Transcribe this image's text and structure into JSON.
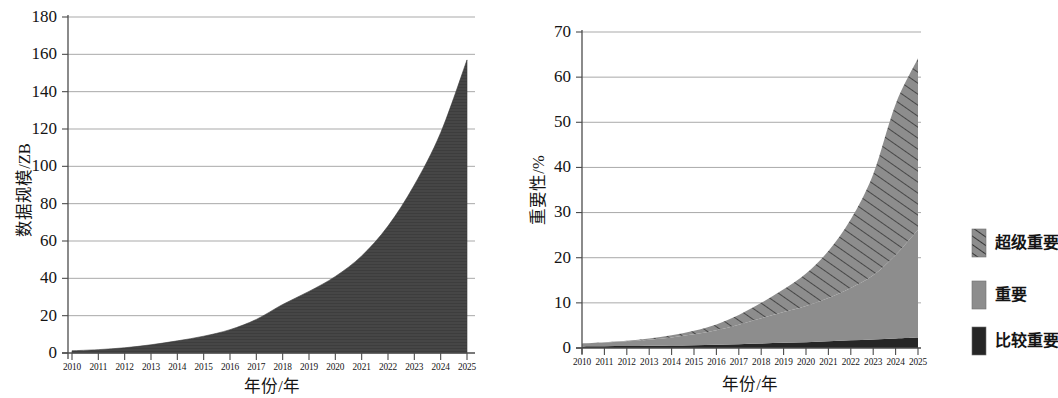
{
  "figure": {
    "panels": [
      "left-data-scale",
      "right-importance"
    ]
  },
  "chart_data": [
    {
      "id": "data-scale",
      "type": "area",
      "title": "",
      "xlabel": "年份/年",
      "ylabel": "数据规模/ZB",
      "xlim": [
        2009.6,
        2025.6
      ],
      "ylim": [
        0,
        180
      ],
      "yticks": [
        0,
        20,
        40,
        60,
        80,
        100,
        120,
        140,
        160,
        180
      ],
      "grid": true,
      "legend": "none",
      "fill_color": "#464646",
      "categories": [
        2010,
        2011,
        2012,
        2013,
        2014,
        2015,
        2016,
        2017,
        2018,
        2019,
        2020,
        2021,
        2022,
        2023,
        2024,
        2025
      ],
      "xtick_labels": [
        "2010",
        "2011",
        "2012",
        "2013",
        "2014",
        "2015",
        "2016",
        "2017",
        "2018",
        "2019",
        "2020",
        "2021",
        "2022",
        "2023",
        "2024",
        "2025"
      ],
      "series": [
        {
          "name": "数据规模",
          "values": [
            1.2,
            1.8,
            2.8,
            4.4,
            6.5,
            9.0,
            12.5,
            18.0,
            26.0,
            33.0,
            41.0,
            52.0,
            68.0,
            90.0,
            118.0,
            157.0
          ]
        }
      ]
    },
    {
      "id": "importance",
      "type": "area",
      "stacked": true,
      "title": "",
      "xlabel": "年份/年",
      "ylabel": "重要性/%",
      "xlim": [
        2009.6,
        2025.6
      ],
      "ylim": [
        0,
        70
      ],
      "yticks": [
        0,
        10,
        20,
        30,
        40,
        50,
        60,
        70
      ],
      "grid": true,
      "legend": "right",
      "categories": [
        2010,
        2011,
        2012,
        2013,
        2014,
        2015,
        2016,
        2017,
        2018,
        2019,
        2020,
        2021,
        2022,
        2023,
        2024,
        2025
      ],
      "xtick_labels": [
        "2010",
        "2011",
        "2012",
        "2013",
        "2014",
        "2015",
        "2016",
        "2017",
        "2018",
        "2019",
        "2020",
        "2021",
        "2022",
        "2023",
        "2024",
        "2025"
      ],
      "series": [
        {
          "name": "比较重要",
          "style": "solid-dark",
          "color": "#262626",
          "values": [
            0.35,
            0.38,
            0.42,
            0.48,
            0.55,
            0.62,
            0.72,
            0.85,
            1.0,
            1.15,
            1.3,
            1.5,
            1.7,
            1.9,
            2.1,
            2.3
          ]
        },
        {
          "name": "重要",
          "style": "solid-gray",
          "color": "#8d8d8d",
          "values": [
            0.65,
            0.82,
            1.05,
            1.35,
            1.8,
            2.4,
            3.2,
            4.3,
            5.6,
            6.8,
            8.0,
            9.6,
            11.6,
            14.2,
            18.5,
            23.9
          ]
        },
        {
          "name": "超级重要",
          "style": "hatched",
          "color": "#8d8d8d",
          "hatch": "diagonal-lines",
          "values": [
            0.0,
            0.05,
            0.13,
            0.27,
            0.45,
            0.78,
            1.3,
            2.15,
            3.4,
            5.05,
            7.2,
            10.4,
            15.2,
            22.4,
            33.4,
            38.0
          ]
        }
      ],
      "legend_entries": [
        {
          "label": "超级重要",
          "style": "hatched",
          "color": "#8d8d8d"
        },
        {
          "label": "重要",
          "style": "solid-gray",
          "color": "#8d8d8d"
        },
        {
          "label": "比较重要",
          "style": "solid-dark",
          "color": "#262626"
        }
      ]
    }
  ]
}
